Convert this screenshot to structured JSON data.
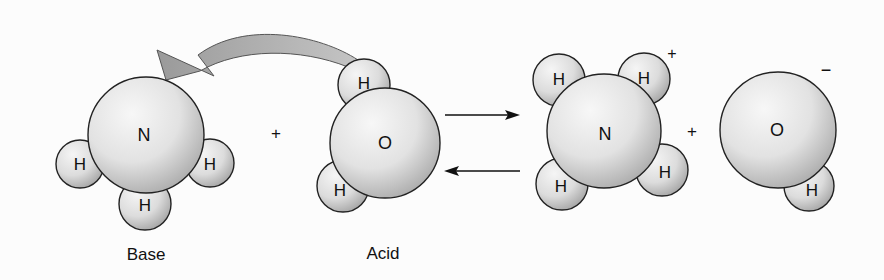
{
  "diagram": {
    "reactants": {
      "base": {
        "caption": "Base",
        "central_atom": "N",
        "hydrogens": [
          "H",
          "H",
          "H"
        ]
      },
      "plus": "+",
      "acid": {
        "caption": "Acid",
        "central_atom": "O",
        "hydrogens": [
          "H",
          "H"
        ]
      }
    },
    "equilibrium_arrows": {
      "forward": "→",
      "reverse": "←"
    },
    "products": {
      "ammonium": {
        "central_atom": "N",
        "hydrogens": [
          "H",
          "H",
          "H",
          "H"
        ],
        "charge": "+"
      },
      "plus": "+",
      "hydroxide": {
        "central_atom": "O",
        "hydrogens": [
          "H"
        ],
        "charge": "−"
      }
    },
    "proton_transfer_arrow": "curved-arrow from acid H to base N",
    "colors": {
      "atom_light": "#f2f2f2",
      "atom_dark": "#b8b8b8",
      "outline": "#222222",
      "curved_arrow": "#a9a9a9"
    }
  }
}
